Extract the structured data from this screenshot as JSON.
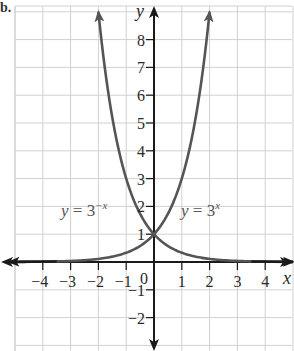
{
  "part_label": "b.",
  "chart_data": {
    "type": "line",
    "title": "",
    "xlabel": "x",
    "ylabel": "y",
    "xlim": [
      -5.0,
      5.0
    ],
    "ylim": [
      -3.2,
      9.1
    ],
    "grid": true,
    "x_ticks": [
      -4,
      -3,
      -2,
      -1,
      1,
      2,
      3,
      4
    ],
    "x_tick_labels": [
      "−4",
      "−3",
      "−2",
      "−1",
      "1",
      "2",
      "3",
      "4"
    ],
    "y_ticks": [
      1,
      2,
      3,
      4,
      5,
      6,
      7,
      8,
      -1,
      -2
    ],
    "y_tick_labels": [
      "1",
      "2",
      "3",
      "4",
      "5",
      "6",
      "7",
      "8",
      "−1",
      "−2"
    ],
    "origin_label": "0",
    "series": [
      {
        "name": "y = 3^x",
        "label_base": "y = 3",
        "label_exp": "x",
        "function": "3^x",
        "x": [
          -4.5,
          -4,
          -3,
          -2,
          -1,
          0,
          1,
          1.5,
          1.9
        ],
        "values": [
          0.007,
          0.012,
          0.037,
          0.111,
          0.333,
          1,
          3,
          5.196,
          8.06
        ],
        "color": "#555555"
      },
      {
        "name": "y = 3^-x",
        "label_base": "y = 3",
        "label_exp": "−x",
        "function": "3^(-x)",
        "x": [
          -1.9,
          -1.5,
          -1,
          0,
          1,
          2,
          3,
          4,
          4.5
        ],
        "values": [
          8.06,
          5.196,
          3,
          1,
          0.333,
          0.111,
          0.037,
          0.012,
          0.007
        ],
        "color": "#555555"
      }
    ],
    "colors": {
      "axis": "#1a1a1a",
      "grid": "#d0d0d0",
      "curve": "#555555",
      "text": "#2a2a2a"
    }
  }
}
